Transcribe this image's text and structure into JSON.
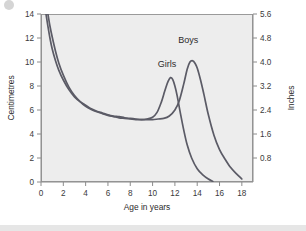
{
  "chart_data": {
    "type": "line",
    "title": "",
    "subtitle": "",
    "xlabel": "Age in years",
    "ylabel": "Centimetres",
    "y2label": "Inches",
    "xlim": [
      0,
      19
    ],
    "ylim": [
      0,
      14
    ],
    "y2lim": [
      0,
      5.6
    ],
    "grid": false,
    "legend_position": "inline-annotation",
    "xticks": [
      0,
      2,
      4,
      6,
      8,
      10,
      12,
      14,
      16,
      18
    ],
    "xtick_labels": [
      "0",
      "2",
      "4",
      "6",
      "8",
      "10",
      "12",
      "14",
      "16",
      "18"
    ],
    "yticks": [
      0,
      2,
      4,
      6,
      8,
      10,
      12,
      14
    ],
    "ytick_labels": [
      "0",
      "2",
      "4",
      "6",
      "8",
      "10",
      "12",
      "14"
    ],
    "y2ticks": [
      0.8,
      1.6,
      2.4,
      3.2,
      4.0,
      4.8,
      5.6
    ],
    "y2tick_labels": [
      "0.8",
      "1.6",
      "2.4",
      "3.2",
      "4.0",
      "4.8",
      "5.6"
    ],
    "annotations": [
      {
        "text": "Girls",
        "x": 11.3,
        "y": 9.6
      },
      {
        "text": "Boys",
        "x": 13.2,
        "y": 11.6
      }
    ],
    "series": [
      {
        "name": "Girls",
        "color": "#5b5b66",
        "peak_age": 11.6,
        "peak_value": 8.7,
        "x": [
          0.45,
          0.6,
          0.8,
          1.0,
          1.3,
          1.6,
          2.0,
          2.5,
          3.0,
          3.5,
          4.0,
          4.5,
          5.0,
          5.5,
          6.0,
          6.5,
          7.0,
          7.5,
          8.0,
          8.5,
          9.0,
          9.5,
          10.0,
          10.4,
          10.8,
          11.0,
          11.2,
          11.4,
          11.6,
          11.8,
          12.0,
          12.2,
          12.5,
          12.8,
          13.1,
          13.5,
          14.0,
          14.5,
          15.0,
          15.4
        ],
        "y": [
          14.0,
          13.1,
          12.0,
          11.1,
          10.1,
          9.3,
          8.5,
          7.7,
          7.1,
          6.7,
          6.4,
          6.1,
          5.9,
          5.75,
          5.6,
          5.5,
          5.45,
          5.35,
          5.3,
          5.25,
          5.2,
          5.25,
          5.4,
          5.8,
          6.7,
          7.3,
          7.9,
          8.4,
          8.7,
          8.55,
          8.0,
          7.2,
          5.7,
          4.3,
          3.1,
          2.0,
          1.1,
          0.6,
          0.25,
          0.05
        ]
      },
      {
        "name": "Boys",
        "color": "#5b5b66",
        "peak_age": 13.6,
        "peak_value": 10.1,
        "x": [
          0.62,
          0.8,
          1.0,
          1.3,
          1.6,
          2.0,
          2.5,
          3.0,
          3.5,
          4.0,
          4.5,
          5.0,
          5.5,
          6.0,
          6.5,
          7.0,
          7.5,
          8.0,
          8.5,
          9.0,
          9.5,
          10.0,
          10.5,
          11.0,
          11.5,
          12.0,
          12.4,
          12.8,
          13.1,
          13.35,
          13.6,
          13.8,
          14.0,
          14.3,
          14.6,
          15.0,
          15.5,
          16.0,
          16.5,
          17.0,
          17.5,
          18.0
        ],
        "y": [
          14.0,
          13.0,
          12.1,
          10.9,
          9.9,
          8.9,
          7.9,
          7.2,
          6.7,
          6.3,
          6.05,
          5.85,
          5.7,
          5.55,
          5.45,
          5.35,
          5.3,
          5.25,
          5.2,
          5.2,
          5.2,
          5.2,
          5.25,
          5.3,
          5.5,
          6.0,
          6.8,
          8.2,
          9.4,
          10.0,
          10.1,
          9.9,
          9.5,
          8.5,
          7.3,
          5.6,
          3.9,
          2.7,
          1.9,
          1.2,
          0.7,
          0.25
        ]
      }
    ]
  },
  "geometry": {
    "plot_left": 41,
    "plot_right": 253,
    "plot_top": 14,
    "plot_bottom": 182
  }
}
